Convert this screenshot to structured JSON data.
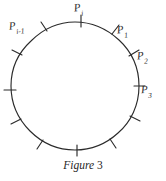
{
  "figure": {
    "caption_word": "Figure",
    "caption_number": "3",
    "shape": "circle",
    "tick_count": 12,
    "tick_spacing_degrees": 30,
    "stroke_color": "#2b2b2b",
    "background_color": "#ffffff",
    "center": {
      "x": 75,
      "y": 86
    },
    "radius": 64,
    "labels": [
      {
        "id": "p-i",
        "base": "P",
        "subscript": "i",
        "angle_degrees": 90,
        "text": "Pi"
      },
      {
        "id": "p-1",
        "base": "P",
        "subscript": "1",
        "angle_degrees": 60,
        "text": "P1"
      },
      {
        "id": "p-2",
        "base": "P",
        "subscript": "2",
        "angle_degrees": 30,
        "text": "P2"
      },
      {
        "id": "p-3",
        "base": "P",
        "subscript": "3",
        "angle_degrees": 0,
        "text": "P3"
      },
      {
        "id": "p-i-minus-1",
        "base": "P",
        "subscript": "i-1",
        "angle_degrees": 120,
        "text": "Pi-1"
      }
    ],
    "tick_angles_degrees": [
      0,
      30,
      60,
      90,
      120,
      150,
      180,
      210,
      240,
      270,
      300,
      330
    ]
  }
}
